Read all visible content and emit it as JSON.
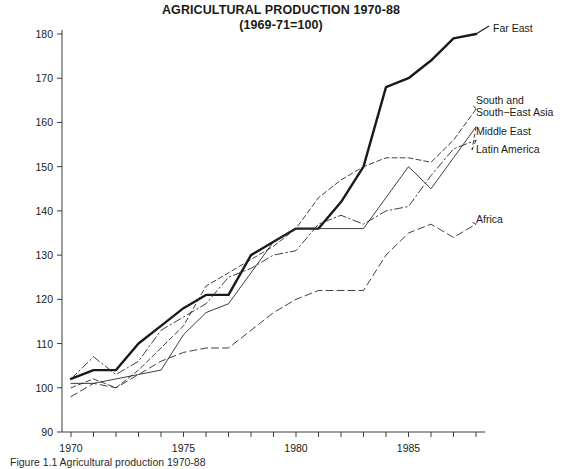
{
  "title": {
    "line1": "AGRICULTURAL PRODUCTION 1970-88",
    "line2": "(1969-71=100)"
  },
  "caption": "Figure 1.1 Agricultural production 1970-88",
  "axes": {
    "y_ticks": [
      "90",
      "100",
      "110",
      "120",
      "130",
      "140",
      "150",
      "160",
      "170",
      "180"
    ],
    "x_ticks": [
      "1970",
      "1975",
      "1980",
      "1985"
    ]
  },
  "labels": {
    "far_east": "Far East",
    "south_asia_l1": "South and",
    "south_asia_l2": "South−East Asia",
    "middle_east": "Middle East",
    "latin_america": "Latin America",
    "africa": "Africa"
  },
  "chart_data": {
    "type": "line",
    "title": "AGRICULTURAL PRODUCTION 1970-88 (1969-71=100)",
    "subtitle": "(1969-71=100)",
    "xlabel": "",
    "ylabel": "",
    "xlim": [
      1969.6,
      1988.4
    ],
    "ylim": [
      90,
      180
    ],
    "grid": false,
    "legend_position": "right-inline-annotations",
    "x": [
      1970,
      1971,
      1972,
      1973,
      1974,
      1975,
      1976,
      1977,
      1978,
      1979,
      1980,
      1981,
      1982,
      1983,
      1984,
      1985,
      1986,
      1987,
      1988
    ],
    "series": [
      {
        "name": "Far East",
        "style": "solid-bold",
        "color": "#1a1a1a",
        "values": [
          102,
          104,
          104,
          110,
          114,
          118,
          121,
          121,
          130,
          133,
          136,
          136,
          142,
          150,
          168,
          170,
          174,
          179,
          180
        ]
      },
      {
        "name": "South and South−East Asia",
        "style": "dashed",
        "color": "#2a2a2a",
        "values": [
          100,
          102,
          100,
          104,
          109,
          114,
          123,
          126,
          129,
          132,
          136,
          143,
          147,
          150,
          152,
          152,
          151,
          156,
          163
        ]
      },
      {
        "name": "Middle East",
        "style": "solid-thin",
        "color": "#2a2a2a",
        "values": [
          101,
          101,
          102,
          103,
          104,
          112,
          117,
          119,
          126,
          133,
          136,
          136,
          136,
          136,
          143,
          150,
          145,
          152,
          159
        ]
      },
      {
        "name": "Latin America",
        "style": "dash-dot",
        "color": "#2a2a2a",
        "values": [
          102,
          107,
          103,
          106,
          113,
          116,
          119,
          125,
          127,
          130,
          131,
          137,
          139,
          137,
          140,
          141,
          148,
          154,
          156
        ]
      },
      {
        "name": "Africa",
        "style": "long-dash",
        "color": "#2a2a2a",
        "values": [
          98,
          101,
          100,
          103,
          106,
          108,
          109,
          109,
          113,
          117,
          120,
          122,
          122,
          122,
          130,
          135,
          137,
          134,
          137
        ]
      }
    ]
  }
}
